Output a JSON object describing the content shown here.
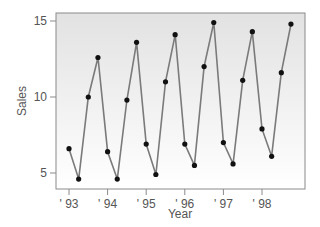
{
  "chart_data": {
    "type": "line",
    "title": "",
    "xlabel": "Year",
    "ylabel": "Sales",
    "ylim": [
      4,
      15.5
    ],
    "yticks": [
      5,
      10,
      15
    ],
    "xtick_labels": [
      "' 93",
      "' 94",
      "' 95",
      "' 96",
      "' 97",
      "' 98"
    ],
    "grid": false,
    "legend": null,
    "x": [
      "93Q1",
      "93Q2",
      "93Q3",
      "93Q4",
      "94Q1",
      "94Q2",
      "94Q3",
      "94Q4",
      "95Q1",
      "95Q2",
      "95Q3",
      "95Q4",
      "96Q1",
      "96Q2",
      "96Q3",
      "96Q4",
      "97Q1",
      "97Q2",
      "97Q3",
      "97Q4",
      "98Q1",
      "98Q2",
      "98Q3",
      "98Q4"
    ],
    "series": [
      {
        "name": "Sales",
        "values": [
          6.6,
          4.6,
          10.0,
          12.6,
          6.4,
          4.6,
          9.8,
          13.6,
          6.9,
          4.9,
          11.0,
          14.1,
          6.9,
          5.5,
          12.0,
          14.9,
          7.0,
          5.6,
          11.1,
          14.3,
          7.9,
          6.1,
          11.6,
          14.8
        ]
      }
    ],
    "colors": {
      "line": "#7a7a7a",
      "marker": "#111111",
      "frame": "#8a8a8a",
      "bg_top": "#e4e4e4",
      "bg_bottom": "#ffffff"
    }
  }
}
